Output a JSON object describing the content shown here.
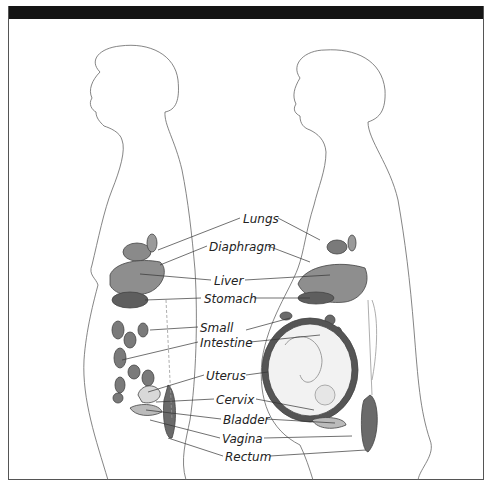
{
  "figure": {
    "title_bar": "",
    "left_figure": "non-pregnant",
    "right_figure": "pregnant"
  },
  "labels": [
    {
      "text": "Lungs",
      "x": 243,
      "y": 213
    },
    {
      "text": "Diaphragm",
      "x": 209,
      "y": 241
    },
    {
      "text": "Liver",
      "x": 214,
      "y": 275
    },
    {
      "text": "Stomach",
      "x": 204,
      "y": 293
    },
    {
      "text": "Small",
      "x": 200,
      "y": 322
    },
    {
      "text": "Intestine",
      "x": 200,
      "y": 337
    },
    {
      "text": "Uterus",
      "x": 206,
      "y": 370
    },
    {
      "text": "Cervix",
      "x": 216,
      "y": 394
    },
    {
      "text": "Bladder",
      "x": 223,
      "y": 414
    },
    {
      "text": "Vagina",
      "x": 222,
      "y": 433
    },
    {
      "text": "Rectum",
      "x": 225,
      "y": 451
    }
  ],
  "colors": {
    "frame": "#555555",
    "topbar": "#151515",
    "organ_fill": "#8a8a8a",
    "organ_dark": "#5a5a5a",
    "line": "#444444"
  }
}
